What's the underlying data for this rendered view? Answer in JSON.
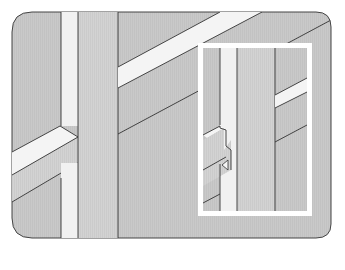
{
  "diagram": {
    "type": "technical-illustration",
    "colors": {
      "background": "#ffffff",
      "panel_fill": "#c9c9c9",
      "stud_face": "#d2d2d2",
      "stud_edge_light": "#f1f1f1",
      "brace_top_light": "#f4f4f4",
      "line": "#333333",
      "inset_frame": "#ffffff",
      "inset_fill": "#c6c6c6"
    },
    "elements": [
      {
        "id": "main-panel",
        "label": "Framing wall panel"
      },
      {
        "id": "stud-left",
        "label": "Vertical stud"
      },
      {
        "id": "brace-left",
        "label": "Diagonal brace (lower left)"
      },
      {
        "id": "brace-right",
        "label": "Diagonal brace (upper right)"
      },
      {
        "id": "detail-inset",
        "label": "Notched joint detail"
      }
    ]
  }
}
